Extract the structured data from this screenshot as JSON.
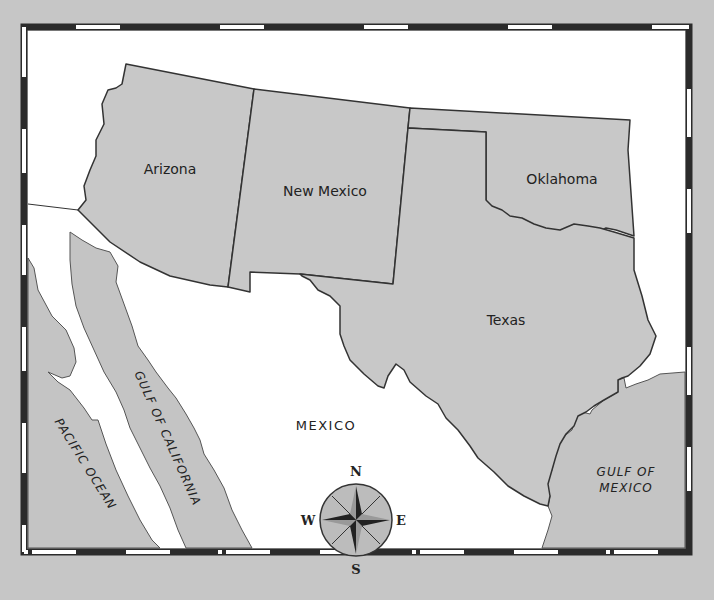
{
  "map": {
    "states": [
      {
        "id": "arizona",
        "label": "Arizona"
      },
      {
        "id": "new-mexico",
        "label": "New Mexico"
      },
      {
        "id": "oklahoma",
        "label": "Oklahoma"
      },
      {
        "id": "texas",
        "label": "Texas"
      }
    ],
    "country_label": "MEXICO",
    "water_labels": {
      "pacific": "PACIFIC OCEAN",
      "gulf_california": "GULF OF CALIFORNIA",
      "gulf_mexico_line1": "GULF OF",
      "gulf_mexico_line2": "MEXICO"
    },
    "compass": {
      "n": "N",
      "s": "S",
      "e": "E",
      "w": "W"
    },
    "colors": {
      "background": "#c6c6c6",
      "state_fill": "#c8c8c8",
      "land_fill": "#ffffff",
      "border_dark": "#2b2b2b",
      "border_light": "#ffffff"
    }
  }
}
